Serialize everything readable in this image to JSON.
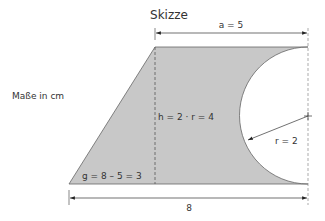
{
  "title": "Skizze",
  "units_note": "Maße in cm",
  "labels": {
    "a": "a = 5",
    "h": "h = 2 · r = 4",
    "g": "g = 8 – 5 = 3",
    "r": "r = 2",
    "base": "8"
  },
  "colors": {
    "fill": "#c8c8c8",
    "stroke": "#555555",
    "dimension": "#333333"
  },
  "shape": {
    "description": "Trapezoid with a semicircle cut out of the right side",
    "base_length": 8,
    "top_length": 5,
    "height": 4,
    "slant_offset": 3,
    "semicircle_radius": 2
  }
}
